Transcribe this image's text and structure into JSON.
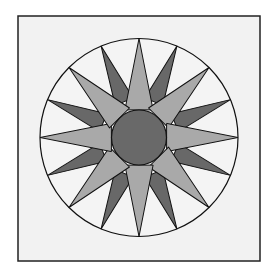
{
  "figure": {
    "points_total": 16,
    "light_points": 8,
    "dark_points": 8
  },
  "colors": {
    "page": "#ffffff",
    "block_background": "#f2f2f2",
    "frame_stroke": "#222222",
    "outline": "#111111",
    "light_point_fill": "#a9a9a9",
    "dark_point_fill": "#686868",
    "center_fill": "#696969",
    "gap_fill": "#ffffff"
  },
  "geometry": {
    "frame": {
      "x": 18,
      "y": 16,
      "width": 242,
      "height": 245
    },
    "center": {
      "x": 139,
      "y": 137.5
    },
    "outer_radius": 99,
    "center_radius": 27.5
  }
}
